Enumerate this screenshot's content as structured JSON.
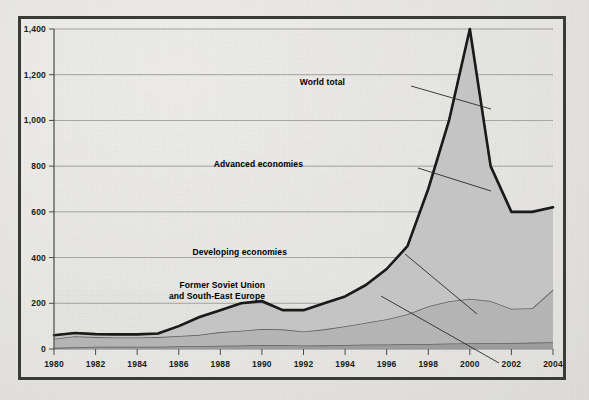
{
  "chart_data": {
    "type": "area",
    "title": "",
    "subtitle": "",
    "xlabel": "",
    "ylabel": "",
    "stacked": true,
    "grid": true,
    "legend_position": "inline-annotations",
    "xlim": [
      1980,
      2004
    ],
    "ylim": [
      0,
      1400
    ],
    "x": [
      1980,
      1981,
      1982,
      1983,
      1984,
      1985,
      1986,
      1987,
      1988,
      1989,
      1990,
      1991,
      1992,
      1993,
      1994,
      1995,
      1996,
      1997,
      1998,
      1999,
      2000,
      2001,
      2002,
      2003,
      2004
    ],
    "xticks": [
      "1980",
      "1982",
      "1984",
      "1986",
      "1988",
      "1990",
      "1992",
      "1994",
      "1996",
      "1998",
      "2000",
      "2002",
      "2004"
    ],
    "yticks": [
      "0",
      "200",
      "400",
      "600",
      "800",
      "1,000",
      "1,200",
      "1,400"
    ],
    "ytick_values": [
      0,
      200,
      400,
      600,
      800,
      1000,
      1200,
      1400
    ],
    "series": [
      {
        "name": "Former Soviet Union and South-East Europe",
        "fill": "#9a9a9a",
        "values": [
          5,
          8,
          10,
          10,
          10,
          10,
          12,
          12,
          14,
          15,
          18,
          18,
          15,
          16,
          18,
          20,
          20,
          22,
          22,
          24,
          25,
          25,
          26,
          28,
          30
        ]
      },
      {
        "name": "Developing economies",
        "fill": "#b4b4b4",
        "values": [
          40,
          48,
          42,
          40,
          40,
          42,
          45,
          50,
          60,
          65,
          70,
          68,
          62,
          70,
          82,
          95,
          110,
          130,
          165,
          185,
          195,
          185,
          150,
          150,
          230
        ]
      },
      {
        "name": "Advanced economies",
        "fill": "#c4c4c4",
        "values": [
          15,
          14,
          13,
          14,
          14,
          16,
          43,
          78,
          96,
          120,
          117,
          84,
          93,
          114,
          130,
          165,
          220,
          298,
          513,
          791,
          1180,
          590,
          424,
          422,
          360
        ]
      }
    ],
    "total_series": {
      "name": "World total",
      "values": [
        60,
        70,
        65,
        64,
        64,
        68,
        100,
        140,
        170,
        200,
        210,
        170,
        170,
        200,
        230,
        280,
        350,
        450,
        700,
        1000,
        1400,
        800,
        600,
        600,
        620
      ]
    },
    "annotations": [
      {
        "id": "world-total",
        "label": "World total",
        "x_px": 324,
        "y_px": 64,
        "align": "right",
        "leader": [
          [
            390,
            67
          ],
          [
            470,
            90
          ]
        ]
      },
      {
        "id": "advanced-economies",
        "label": "Advanced economies",
        "x_px": 282,
        "y_px": 146,
        "align": "right",
        "leader": [
          [
            397,
            149
          ],
          [
            470,
            172
          ]
        ]
      },
      {
        "id": "developing-economies",
        "label": "Developing economies",
        "x_px": 266,
        "y_px": 234,
        "align": "right",
        "leader": [
          [
            384,
            235
          ],
          [
            456,
            295
          ]
        ]
      },
      {
        "id": "former-soviet-union",
        "label": "Former Soviet Union",
        "label2": "and South-East Europe",
        "x_px": 244,
        "y_px": 267,
        "align": "right",
        "leader": [
          [
            360,
            277
          ],
          [
            478,
            344
          ]
        ]
      }
    ]
  },
  "colors": {
    "frame": "#3a3a3a",
    "paper": "#e8e7e3",
    "gridline": "#6f6f6f",
    "total_line": "#1a1a1a",
    "band_top": "#c4c4c4",
    "band_mid": "#b4b4b4",
    "band_bottom": "#9a9a9a"
  }
}
